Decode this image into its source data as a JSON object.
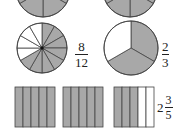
{
  "colors": {
    "shaded": "#a8a8a8",
    "unshaded": "#ffffff",
    "stroke": "#444444"
  },
  "figures": {
    "top_left_circle": {
      "parts": 6,
      "shaded_parts": 4,
      "partially_visible": true
    },
    "top_right_circle": {
      "parts": 6,
      "shaded_parts": 4,
      "partially_visible": true
    },
    "circle_twelfths": {
      "parts": 12,
      "shaded_parts": 8,
      "label": {
        "numerator": "8",
        "denominator": "12"
      }
    },
    "circle_thirds": {
      "parts": 3,
      "shaded_parts": 2,
      "label": {
        "numerator": "2",
        "denominator": "3"
      }
    },
    "bar_models": {
      "bars": [
        {
          "parts": 5,
          "shaded_parts": 5
        },
        {
          "parts": 5,
          "shaded_parts": 5
        },
        {
          "parts": 5,
          "shaded_parts": 3
        }
      ],
      "label": {
        "whole": "2",
        "numerator": "3",
        "denominator": "5"
      }
    }
  }
}
